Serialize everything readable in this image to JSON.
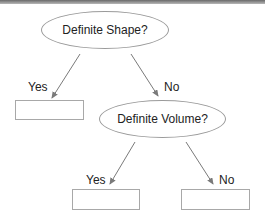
{
  "diagram": {
    "type": "decision-tree",
    "nodes": {
      "root": {
        "text": "Definite Shape?"
      },
      "volume": {
        "text": "Definite Volume?"
      },
      "shape_yes_box": {
        "text": ""
      },
      "volume_yes_box": {
        "text": ""
      },
      "volume_no_box": {
        "text": ""
      }
    },
    "edges": {
      "root_yes": {
        "label": "Yes"
      },
      "root_no": {
        "label": "No"
      },
      "volume_yes": {
        "label": "Yes"
      },
      "volume_no": {
        "label": "No"
      }
    },
    "colors": {
      "stroke": "#9a9a9a",
      "arrow": "#7a7a7a",
      "text": "#222222"
    }
  }
}
